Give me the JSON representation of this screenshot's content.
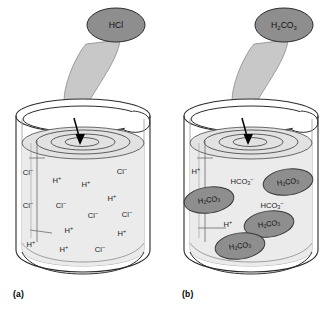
{
  "figure": {
    "colors": {
      "outline": "#2b2b2b",
      "liquid_fill": "#ebebeb",
      "surface_fill": "#e2e2e2",
      "stream_fill": "#c8c8c8",
      "bubble_fill": "#8e8e8e",
      "molecule_fill": "#8e8e8e",
      "background": "#ffffff",
      "text": "#1a1a1a"
    }
  },
  "panels": [
    {
      "id": "a",
      "caption": "(a)",
      "pour_label": {
        "formula": "HCl",
        "parts": [
          {
            "t": "HCl",
            "k": "n"
          }
        ]
      },
      "particles": [
        {
          "parts": [
            {
              "t": "Cl",
              "k": "n"
            },
            {
              "t": "−",
              "k": "sup"
            }
          ],
          "x": 28,
          "y": 173
        },
        {
          "parts": [
            {
              "t": "H",
              "k": "n"
            },
            {
              "t": "+",
              "k": "sup"
            }
          ],
          "x": 57,
          "y": 181
        },
        {
          "parts": [
            {
              "t": "H",
              "k": "n"
            },
            {
              "t": "+",
              "k": "sup"
            }
          ],
          "x": 86,
          "y": 185
        },
        {
          "parts": [
            {
              "t": "Cl",
              "k": "n"
            },
            {
              "t": "−",
              "k": "sup"
            }
          ],
          "x": 122,
          "y": 172
        },
        {
          "parts": [
            {
              "t": "H",
              "k": "n"
            },
            {
              "t": "+",
              "k": "sup"
            }
          ],
          "x": 112,
          "y": 199
        },
        {
          "parts": [
            {
              "t": "Cl",
              "k": "n"
            },
            {
              "t": "−",
              "k": "sup"
            }
          ],
          "x": 28,
          "y": 206
        },
        {
          "parts": [
            {
              "t": "Cl",
              "k": "n"
            },
            {
              "t": "−",
              "k": "sup"
            }
          ],
          "x": 61,
          "y": 206
        },
        {
          "parts": [
            {
              "t": "Cl",
              "k": "n"
            },
            {
              "t": "−",
              "k": "sup"
            }
          ],
          "x": 93,
          "y": 216
        },
        {
          "parts": [
            {
              "t": "Cl",
              "k": "n"
            },
            {
              "t": "−",
              "k": "sup"
            }
          ],
          "x": 127,
          "y": 215
        },
        {
          "parts": [
            {
              "t": "H",
              "k": "n"
            },
            {
              "t": "+",
              "k": "sup"
            }
          ],
          "x": 69,
          "y": 231
        },
        {
          "parts": [
            {
              "t": "H",
              "k": "n"
            },
            {
              "t": "+",
              "k": "sup"
            }
          ],
          "x": 122,
          "y": 234
        },
        {
          "parts": [
            {
              "t": "H",
              "k": "n"
            },
            {
              "t": "+",
              "k": "sup"
            }
          ],
          "x": 31,
          "y": 245
        },
        {
          "parts": [
            {
              "t": "H",
              "k": "n"
            },
            {
              "t": "+",
              "k": "sup"
            }
          ],
          "x": 64,
          "y": 250
        },
        {
          "parts": [
            {
              "t": "Cl",
              "k": "n"
            },
            {
              "t": "−",
              "k": "sup"
            }
          ],
          "x": 100,
          "y": 250
        }
      ],
      "molecules": []
    },
    {
      "id": "b",
      "caption": "(b)",
      "pour_label": {
        "formula": "H2CO3",
        "parts": [
          {
            "t": "H",
            "k": "n"
          },
          {
            "t": "2",
            "k": "sub"
          },
          {
            "t": "CO",
            "k": "n"
          },
          {
            "t": "3",
            "k": "sub"
          }
        ]
      },
      "particles": [
        {
          "parts": [
            {
              "t": "H",
              "k": "n"
            },
            {
              "t": "+",
              "k": "sup"
            }
          ],
          "x": 28,
          "y": 172
        },
        {
          "parts": [
            {
              "t": "HCO",
              "k": "n"
            },
            {
              "t": "3",
              "k": "sub"
            },
            {
              "t": "−",
              "k": "sup"
            }
          ],
          "x": 74,
          "y": 182
        },
        {
          "parts": [
            {
              "t": "HCO",
              "k": "n"
            },
            {
              "t": "3",
              "k": "sub"
            },
            {
              "t": "−",
              "k": "sup"
            }
          ],
          "x": 104,
          "y": 206
        },
        {
          "parts": [
            {
              "t": "H",
              "k": "n"
            },
            {
              "t": "+",
              "k": "sup"
            }
          ],
          "x": 60,
          "y": 225
        }
      ],
      "molecules": [
        {
          "parts": [
            {
              "t": "H",
              "k": "n"
            },
            {
              "t": "2",
              "k": "sub"
            },
            {
              "t": "CO",
              "k": "n"
            },
            {
              "t": "3",
              "k": "sub"
            }
          ],
          "cx": 120,
          "cy": 182,
          "rx": 25,
          "ry": 13
        },
        {
          "parts": [
            {
              "t": "H",
              "k": "n"
            },
            {
              "t": "2",
              "k": "sub"
            },
            {
              "t": "CO",
              "k": "n"
            },
            {
              "t": "3",
              "k": "sub"
            }
          ],
          "cx": 41,
          "cy": 200,
          "rx": 25,
          "ry": 13
        },
        {
          "parts": [
            {
              "t": "H",
              "k": "n"
            },
            {
              "t": "2",
              "k": "sub"
            },
            {
              "t": "CO",
              "k": "n"
            },
            {
              "t": "3",
              "k": "sub"
            }
          ],
          "cx": 101,
          "cy": 224,
          "rx": 25,
          "ry": 13
        },
        {
          "parts": [
            {
              "t": "H",
              "k": "n"
            },
            {
              "t": "2",
              "k": "sub"
            },
            {
              "t": "CO",
              "k": "n"
            },
            {
              "t": "3",
              "k": "sub"
            }
          ],
          "cx": 72,
          "cy": 246,
          "rx": 25,
          "ry": 13
        }
      ]
    }
  ]
}
